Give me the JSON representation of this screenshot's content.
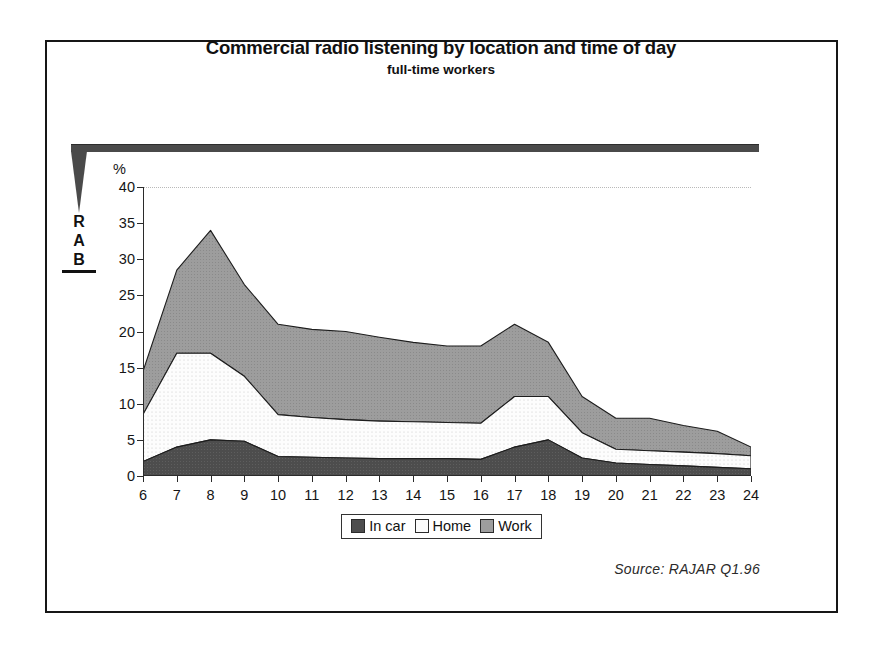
{
  "header": {
    "title": "Commercial radio listening by location and time of day",
    "subtitle": "full-time workers"
  },
  "logo": {
    "name": "rab-logo",
    "line1": "R",
    "line2": "A",
    "line3": "B"
  },
  "axis": {
    "y_unit_label": "%",
    "y_ticks": [
      "0",
      "5",
      "10",
      "15",
      "20",
      "25",
      "30",
      "35",
      "40"
    ],
    "x_ticks": [
      "6",
      "7",
      "8",
      "9",
      "10",
      "11",
      "12",
      "13",
      "14",
      "15",
      "16",
      "17",
      "18",
      "19",
      "20",
      "21",
      "22",
      "23",
      "24"
    ]
  },
  "legend": {
    "items": [
      {
        "label": "In car",
        "color": "#4d4d4d"
      },
      {
        "label": "Home",
        "color": "#fbfbfb"
      },
      {
        "label": "Work",
        "color": "#9d9d9d"
      }
    ]
  },
  "footer": {
    "source": "Source:  RAJAR Q1.96"
  },
  "chart_data": {
    "type": "area",
    "stacked": true,
    "title": "Commercial radio listening by location and time of day",
    "subtitle": "full-time workers",
    "xlabel": "",
    "ylabel": "%",
    "ylim": [
      0,
      40
    ],
    "ytick_step": 5,
    "grid": false,
    "legend_position": "bottom",
    "x": [
      6,
      7,
      8,
      9,
      10,
      11,
      12,
      13,
      14,
      15,
      16,
      17,
      18,
      19,
      20,
      21,
      22,
      23,
      24
    ],
    "series": [
      {
        "name": "In car",
        "color": "#4d4d4d",
        "values": [
          2.0,
          4.0,
          5.0,
          4.8,
          2.7,
          2.6,
          2.5,
          2.4,
          2.4,
          2.4,
          2.3,
          4.0,
          5.0,
          2.5,
          1.8,
          1.6,
          1.4,
          1.2,
          1.0
        ]
      },
      {
        "name": "Home",
        "color": "#fbfbfb",
        "values": [
          6.5,
          13.0,
          12.0,
          9.0,
          5.8,
          5.5,
          5.3,
          5.2,
          5.1,
          5.0,
          5.0,
          7.0,
          6.0,
          3.5,
          1.9,
          1.9,
          1.9,
          1.9,
          1.8
        ]
      },
      {
        "name": "Work",
        "color": "#9d9d9d",
        "values": [
          6.0,
          11.5,
          17.0,
          12.7,
          12.5,
          12.2,
          12.2,
          11.6,
          11.0,
          10.6,
          10.7,
          10.0,
          7.5,
          5.0,
          4.3,
          4.5,
          3.7,
          3.1,
          1.2
        ]
      }
    ],
    "totals": [
      14.5,
      28.5,
      34.0,
      26.5,
      21.0,
      20.3,
      20.0,
      19.2,
      18.5,
      18.0,
      18.0,
      21.0,
      18.5,
      11.0,
      8.0,
      8.0,
      7.0,
      6.2,
      4.0
    ],
    "source": "Source:  RAJAR Q1.96"
  }
}
